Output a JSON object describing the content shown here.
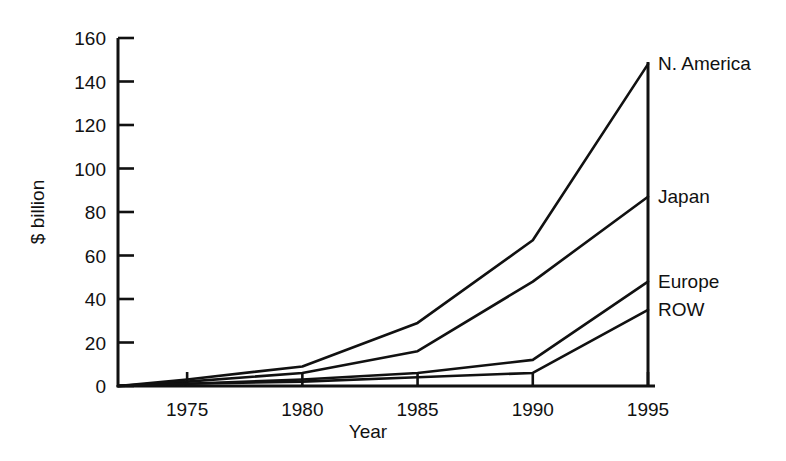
{
  "chart_data": {
    "type": "line",
    "title": "",
    "subtitle": "",
    "xlabel": "Year",
    "ylabel": "$ billion",
    "x": [
      1972,
      1975,
      1980,
      1985,
      1990,
      1995
    ],
    "xlim": [
      1972,
      1995
    ],
    "ylim": [
      0,
      160
    ],
    "xticks": [
      1975,
      1980,
      1985,
      1990,
      1995
    ],
    "xtick_labels": [
      "1975",
      "1980",
      "1985",
      "1990",
      "1995"
    ],
    "yticks": [
      0,
      20,
      40,
      60,
      80,
      100,
      120,
      140,
      160
    ],
    "ytick_labels": [
      "0",
      "20",
      "40",
      "60",
      "80",
      "100",
      "120",
      "140",
      "160"
    ],
    "grid": false,
    "legend_position": "right-inline-labels",
    "stacked_cumulative": true,
    "series": [
      {
        "name": "N. America",
        "label": "N. America",
        "values": [
          0,
          3,
          9,
          29,
          67,
          148
        ]
      },
      {
        "name": "Japan",
        "label": "Japan",
        "values": [
          0,
          2,
          6,
          16,
          48,
          87
        ]
      },
      {
        "name": "Europe",
        "label": "Europe",
        "values": [
          0,
          1,
          3,
          6,
          12,
          48
        ]
      },
      {
        "name": "ROW",
        "label": "ROW",
        "values": [
          0,
          1,
          2,
          4,
          6,
          35
        ]
      }
    ],
    "annotations": [
      {
        "text": "N. America",
        "x": 1995,
        "y": 148
      },
      {
        "text": "Japan",
        "x": 1995,
        "y": 87
      },
      {
        "text": "Europe",
        "x": 1995,
        "y": 48
      },
      {
        "text": "ROW",
        "x": 1995,
        "y": 35
      }
    ],
    "colors": {
      "line": "#111111",
      "axis": "#111111",
      "background": "#ffffff"
    }
  }
}
